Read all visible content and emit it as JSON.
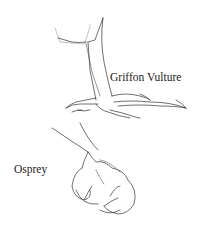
{
  "illustration": {
    "labels": {
      "griffon_vulture": "Griffon Vulture",
      "osprey": "Osprey"
    },
    "colors": {
      "ink": "#222222",
      "background": "#ffffff"
    }
  }
}
